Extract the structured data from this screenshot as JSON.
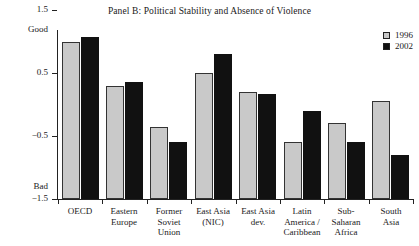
{
  "chart_data": {
    "type": "bar",
    "title": "Panel B: Political Stability and Absence of Violence",
    "xlabel": "",
    "ylabel": "",
    "ylim": [
      -1.5,
      1.8
    ],
    "yticks": [
      1.5,
      0.5,
      -0.5,
      -1.5
    ],
    "ytick_labels": [
      "1.5",
      "0.5",
      "-0.5",
      "-1.5"
    ],
    "axis_end_labels": {
      "top": "Good",
      "bottom": "Bad"
    },
    "grid": false,
    "legend_position": "top-right",
    "categories": [
      "OECD",
      "Eastern\nEurope",
      "Former\nSoviet\nUnion",
      "East Asia\n(NIC)",
      "East Asia\ndev.",
      "Latin\nAmerica /\nCaribbean",
      "Sub-\nSaharan\nAfrica",
      "South\nAsia"
    ],
    "series": [
      {
        "name": "1996",
        "color": "#c9c9c9",
        "values": [
          1.0,
          0.3,
          -0.35,
          0.5,
          0.2,
          -0.6,
          -0.3,
          0.05
        ]
      },
      {
        "name": "2002",
        "color": "#111111",
        "values": [
          1.07,
          0.35,
          -0.6,
          0.8,
          0.17,
          -0.1,
          -0.6,
          -0.8
        ]
      }
    ]
  },
  "legend": {
    "entries": [
      {
        "label": "1996"
      },
      {
        "label": "2002"
      }
    ]
  }
}
